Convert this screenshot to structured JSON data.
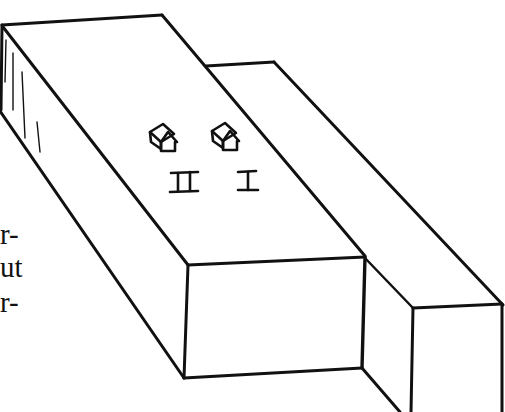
{
  "figure": {
    "ink_color": "#111111",
    "background_color": "#ffffff",
    "labels": {
      "house_left": "II",
      "house_right": "I"
    },
    "houses": [
      {
        "id": "house-2",
        "label": "II"
      },
      {
        "id": "house-1",
        "label": "I"
      }
    ]
  },
  "body_text_fragments": [
    "r-",
    "ut",
    "r-"
  ]
}
